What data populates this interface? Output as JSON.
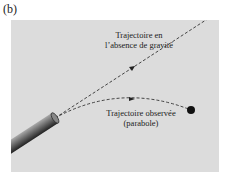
{
  "figure": {
    "panel_label": "(b)",
    "labels": {
      "no_gravity_line1": "Trajectoire en",
      "no_gravity_line2": "l’absence de gravité",
      "observed_line1": "Trajectoire observée",
      "observed_line2": "(parabole)"
    },
    "colors": {
      "background": "#dcdcdc",
      "trajectory": "#333333",
      "ball": "#111111",
      "cannon": "#555555"
    }
  }
}
